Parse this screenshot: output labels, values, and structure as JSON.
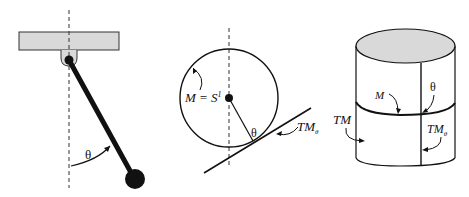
{
  "panels": [
    {
      "id": "pendulum",
      "labels": {
        "angle": "θ"
      }
    },
    {
      "id": "circle",
      "labels": {
        "manifold": "M = S",
        "manifold_sup": "1",
        "angle": "θ",
        "tangent": "TM",
        "tangent_sub": "θ"
      }
    },
    {
      "id": "cylinder",
      "labels": {
        "manifold": "M",
        "angle": "θ",
        "bundle": "TM",
        "fiber": "TM",
        "fiber_sub": "θ"
      }
    }
  ],
  "colors": {
    "stroke": "#111111",
    "fill_gray": "#d9d9d9",
    "dash": "#333333"
  }
}
